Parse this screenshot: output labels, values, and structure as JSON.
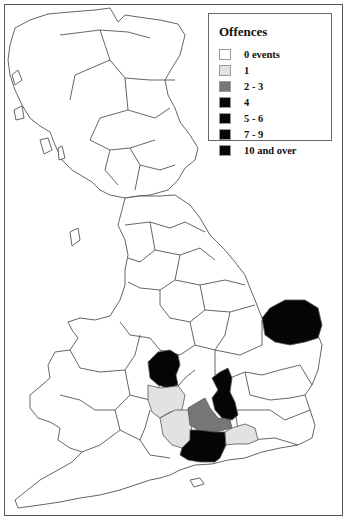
{
  "map": {
    "type": "choropleth",
    "region": "Great Britain (counties)",
    "legend": {
      "title": "Offences",
      "items": [
        {
          "label": "0 events",
          "color": "#ffffff"
        },
        {
          "label": "1",
          "color": "#e2e2e2"
        },
        {
          "label": "2 - 3",
          "color": "#777777"
        },
        {
          "label": "4",
          "color": "#050505"
        },
        {
          "label": "5 - 6",
          "color": "#050505"
        },
        {
          "label": "7 - 9",
          "color": "#050505"
        },
        {
          "label": "10 and over",
          "color": "#050505"
        }
      ]
    },
    "shaded_regions": [
      {
        "area": "Norfolk",
        "class": "10 and over"
      },
      {
        "area": "Gloucestershire (north)",
        "class": "high"
      },
      {
        "area": "Buckinghamshire",
        "class": "high"
      },
      {
        "area": "Hampshire",
        "class": "high"
      },
      {
        "area": "Berkshire",
        "class": "2 - 3"
      },
      {
        "area": "Wiltshire",
        "class": "1"
      },
      {
        "area": "Oxfordshire (west)",
        "class": "1"
      },
      {
        "area": "Surrey",
        "class": "1"
      }
    ]
  }
}
